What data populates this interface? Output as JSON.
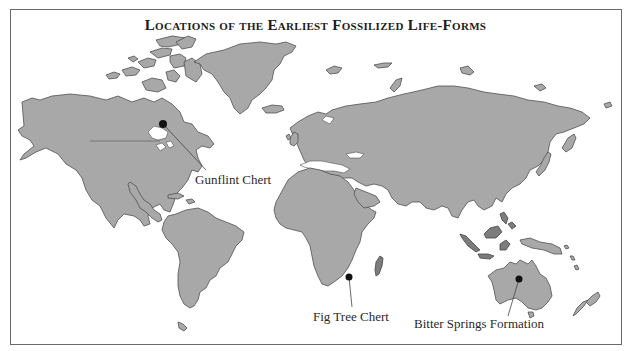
{
  "title": "Locations of the Earliest Fossilized Life-Forms",
  "colors": {
    "land": "#a8a8a8",
    "land_outline": "#505050",
    "islands_dark": "#7c7c7c",
    "marker": "#111111",
    "background": "#ffffff"
  },
  "locations": [
    {
      "name": "Gunflint Chert",
      "region": "North America",
      "marker": [
        163,
        124
      ],
      "label_pos": [
        195,
        172
      ]
    },
    {
      "name": "Fig Tree Chert",
      "region": "Southern Africa",
      "marker": [
        349,
        277
      ],
      "label_pos": [
        313,
        309
      ]
    },
    {
      "name": "Bitter Springs Formation",
      "region": "Australia",
      "marker": [
        519,
        279
      ],
      "label_pos": [
        414,
        316
      ]
    }
  ]
}
